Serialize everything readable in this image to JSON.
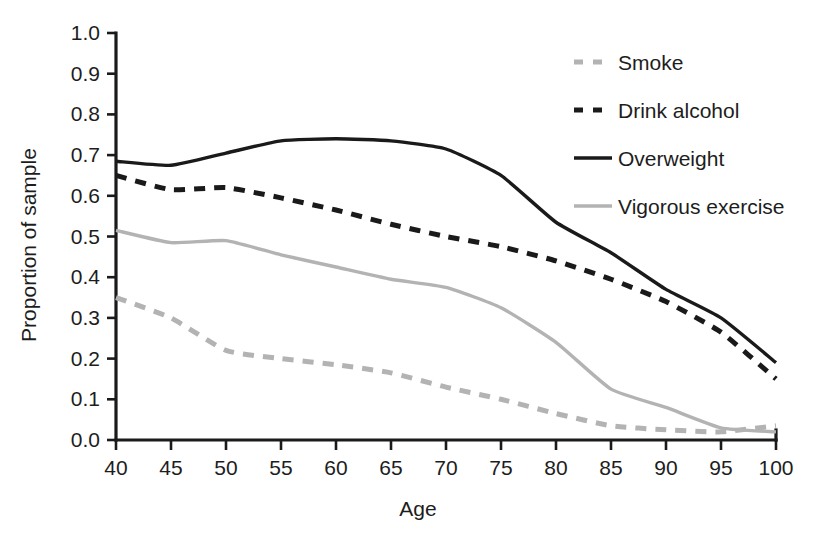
{
  "chart_data": {
    "type": "line",
    "title": "",
    "xlabel": "Age",
    "ylabel": "Proportion of sample",
    "xlim": [
      40,
      100
    ],
    "ylim": [
      0.0,
      1.0
    ],
    "grid": false,
    "legend_position": "top-right",
    "x": [
      40,
      45,
      50,
      55,
      60,
      65,
      70,
      75,
      80,
      85,
      90,
      95,
      100
    ],
    "xtick_labels": [
      "40",
      "45",
      "50",
      "55",
      "60",
      "65",
      "70",
      "75",
      "80",
      "85",
      "90",
      "95",
      "100"
    ],
    "ytick_labels": [
      "0.0",
      "0.1",
      "0.2",
      "0.3",
      "0.4",
      "0.5",
      "0.6",
      "0.7",
      "0.8",
      "0.9",
      "1.0"
    ],
    "ytick_values": [
      0.0,
      0.1,
      0.2,
      0.3,
      0.4,
      0.5,
      0.6,
      0.7,
      0.8,
      0.9,
      1.0
    ],
    "series": [
      {
        "name": "Smoke",
        "color": "#b3b3b3",
        "style": "dashed",
        "values": [
          0.35,
          0.3,
          0.22,
          0.2,
          0.185,
          0.165,
          0.13,
          0.1,
          0.065,
          0.035,
          0.025,
          0.02,
          0.035
        ]
      },
      {
        "name": "Drink alcohol",
        "color": "#1a1a1a",
        "style": "dashed",
        "values": [
          0.65,
          0.615,
          0.62,
          0.595,
          0.565,
          0.53,
          0.5,
          0.475,
          0.44,
          0.395,
          0.34,
          0.265,
          0.15
        ]
      },
      {
        "name": "Overweight",
        "color": "#1a1a1a",
        "style": "solid",
        "values": [
          0.685,
          0.675,
          0.705,
          0.735,
          0.74,
          0.735,
          0.715,
          0.65,
          0.535,
          0.46,
          0.37,
          0.3,
          0.19
        ]
      },
      {
        "name": "Vigorous exercise",
        "color": "#b3b3b3",
        "style": "solid",
        "values": [
          0.515,
          0.485,
          0.49,
          0.455,
          0.425,
          0.395,
          0.375,
          0.325,
          0.24,
          0.125,
          0.08,
          0.03,
          0.02
        ]
      }
    ]
  },
  "legend": {
    "entries": [
      {
        "label": "Smoke",
        "color": "#b3b3b3",
        "style": "dashed"
      },
      {
        "label": "Drink alcohol",
        "color": "#1a1a1a",
        "style": "dashed"
      },
      {
        "label": "Overweight",
        "color": "#1a1a1a",
        "style": "solid"
      },
      {
        "label": "Vigorous exercise",
        "color": "#b3b3b3",
        "style": "solid"
      }
    ]
  },
  "colors": {
    "axis": "#1a1a1a",
    "text": "#1d1d1d",
    "background": "#ffffff",
    "dark_series": "#1a1a1a",
    "light_series": "#b3b3b3"
  }
}
